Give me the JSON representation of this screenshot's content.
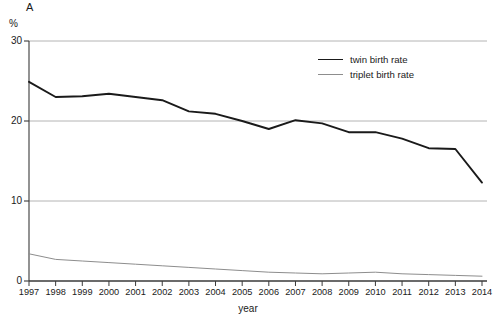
{
  "panel": {
    "label": "A",
    "unit": "%"
  },
  "axis_title_x": "year",
  "legend": {
    "items": [
      {
        "label": "twin birth rate",
        "color": "#1a1a1a",
        "width": 1.9
      },
      {
        "label": "triplet birth rate",
        "color": "#8d8d8d",
        "width": 1.0
      }
    ]
  },
  "chart_data": {
    "type": "line",
    "title": "A",
    "xlabel": "year",
    "ylabel": "%",
    "ylim": [
      0,
      30
    ],
    "yticks": [
      0,
      10,
      20,
      30
    ],
    "grid": true,
    "legend_position": "upper-right-inside",
    "x": [
      1997,
      1998,
      1999,
      2000,
      2001,
      2002,
      2003,
      2004,
      2005,
      2006,
      2007,
      2008,
      2009,
      2010,
      2011,
      2012,
      2013,
      2014
    ],
    "categories": [
      "1997",
      "1998",
      "1999",
      "2000",
      "2001",
      "2002",
      "2003",
      "2004",
      "2005",
      "2006",
      "2007",
      "2008",
      "2009",
      "2010",
      "2011",
      "2012",
      "2013",
      "2014"
    ],
    "series": [
      {
        "name": "twin birth rate",
        "color": "#1a1a1a",
        "values": [
          24.9,
          23.0,
          23.1,
          23.4,
          23.0,
          22.6,
          21.2,
          20.9,
          20.0,
          19.0,
          20.1,
          19.7,
          18.6,
          18.6,
          17.8,
          16.6,
          16.5,
          12.3
        ]
      },
      {
        "name": "triplet birth rate",
        "color": "#8d8d8d",
        "values": [
          3.4,
          2.7,
          2.5,
          2.3,
          2.1,
          1.9,
          1.7,
          1.5,
          1.3,
          1.1,
          1.0,
          0.9,
          1.0,
          1.1,
          0.9,
          0.8,
          0.7,
          0.6
        ]
      }
    ]
  }
}
